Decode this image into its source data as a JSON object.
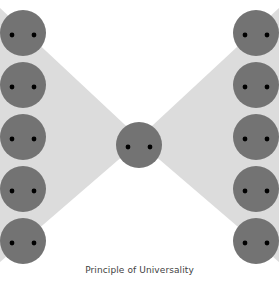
{
  "figure": {
    "width": 279,
    "height": 282,
    "background_color": "#ffffff",
    "caption": "Principle of Universality"
  },
  "diagram": {
    "type": "bowtie-network-diagram",
    "band": {
      "name": "x-shaped-band",
      "color": "#dcdcdc",
      "description": "Light gray bowtie / X shape spanning full width, pinched at center",
      "points": "0,8 139,138 279,8 279,262 139,142 0,262"
    },
    "node_style": {
      "fill": "#737373",
      "radius": 23,
      "eye_color": "#000000",
      "eye_radius": 2.4,
      "eye_offset_x": 11,
      "eye_offset_y": 2
    },
    "nodes": {
      "left_column": [
        {
          "label": "left-node-1",
          "cx": 23,
          "cy": 33
        },
        {
          "label": "left-node-2",
          "cx": 23,
          "cy": 85
        },
        {
          "label": "left-node-3",
          "cx": 23,
          "cy": 137
        },
        {
          "label": "left-node-4",
          "cx": 23,
          "cy": 189
        },
        {
          "label": "left-node-5",
          "cx": 23,
          "cy": 241
        }
      ],
      "center_column": [
        {
          "label": "center-node",
          "cx": 139,
          "cy": 145
        }
      ],
      "right_column": [
        {
          "label": "right-node-1",
          "cx": 256,
          "cy": 33
        },
        {
          "label": "right-node-2",
          "cx": 256,
          "cy": 85
        },
        {
          "label": "right-node-3",
          "cx": 256,
          "cy": 137
        },
        {
          "label": "right-node-4",
          "cx": 256,
          "cy": 189
        },
        {
          "label": "right-node-5",
          "cx": 256,
          "cy": 241
        }
      ]
    },
    "counts": {
      "left": 5,
      "center": 1,
      "right": 5,
      "total": 11
    }
  }
}
